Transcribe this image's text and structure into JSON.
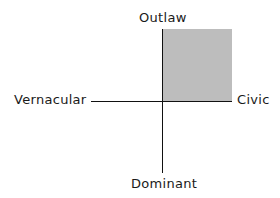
{
  "diagram": {
    "type": "quadrant-axes",
    "axes": {
      "top": "Outlaw",
      "bottom": "Dominant",
      "left": "Vernacular",
      "right": "Civic"
    },
    "highlighted_quadrant": "top-right",
    "highlight_color": "#bdbdbd",
    "line_color": "#111111"
  }
}
